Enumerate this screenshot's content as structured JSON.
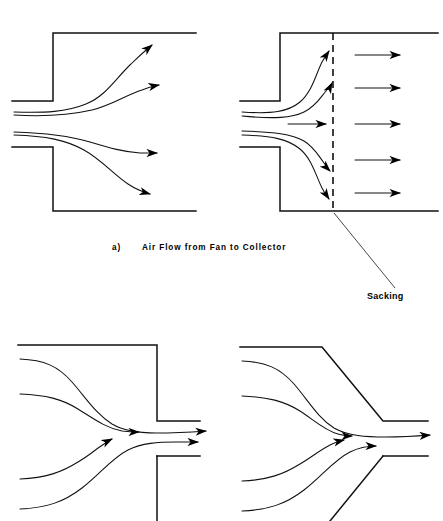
{
  "figure": {
    "title_caption": "a)    Air Flow from Fan to Collector",
    "caption_label": "a)",
    "caption_body": "Air Flow from Fan to Collector",
    "annotation_label": "Sacking",
    "line_color": "#111111",
    "arrow_color": "#000000",
    "background_color": "#ffffff",
    "panels": [
      {
        "id": "top-left",
        "name": "fan-outlet-abrupt-expansion",
        "description": "Air flow from duct into plain expansion chamber",
        "streamline_count": 4,
        "arrow_count": 4,
        "has_sacking": false
      },
      {
        "id": "top-right",
        "name": "fan-outlet-with-sacking",
        "description": "Air flow from duct into chamber fitted with sacking filter",
        "streamline_count": 5,
        "arrow_count": 10,
        "has_sacking": true
      },
      {
        "id": "bottom-left",
        "name": "collector-inlet-abrupt-contraction",
        "description": "Air flow converging into abrupt duct contraction",
        "streamline_count": 4,
        "arrow_count": 4,
        "has_sacking": false
      },
      {
        "id": "bottom-right",
        "name": "collector-inlet-tapered-contraction",
        "description": "Air flow converging into tapered conical duct contraction",
        "streamline_count": 4,
        "arrow_count": 4,
        "has_sacking": false
      }
    ]
  }
}
